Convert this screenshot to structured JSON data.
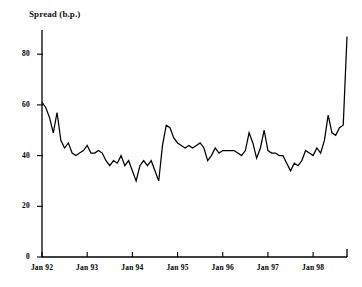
{
  "chart_data": {
    "type": "line",
    "title": "Spread (b.p.)",
    "xlabel": "",
    "ylabel": "Spread (b.p.)",
    "ylim": [
      0,
      92
    ],
    "yticks": [
      0,
      20,
      40,
      60,
      80
    ],
    "ytick_labels": [
      "0",
      "20",
      "40",
      "60",
      "80"
    ],
    "xticks": [
      "Jan 92",
      "Jan 93",
      "Jan 94",
      "Jan 95",
      "Jan 96",
      "Jan 97",
      "Jan 98"
    ],
    "xtick_labels": [
      "Jan 92",
      "Jan 93",
      "Jan 94",
      "Jan 95",
      "Jan 96",
      "Jan 97",
      "Jan 98"
    ],
    "xlim_labels": [
      "Jan 92",
      "Oct 98"
    ],
    "grid": false,
    "legend": "none",
    "line_color": "#000000",
    "x": [
      "Jan 92",
      "Feb 92",
      "Mar 92",
      "Apr 92",
      "May 92",
      "Jun 92",
      "Jul 92",
      "Aug 92",
      "Sep 92",
      "Oct 92",
      "Nov 92",
      "Dec 92",
      "Jan 93",
      "Feb 93",
      "Mar 93",
      "Apr 93",
      "May 93",
      "Jun 93",
      "Jul 93",
      "Aug 93",
      "Sep 93",
      "Oct 93",
      "Nov 93",
      "Dec 93",
      "Jan 94",
      "Feb 94",
      "Mar 94",
      "Apr 94",
      "May 94",
      "Jun 94",
      "Jul 94",
      "Aug 94",
      "Sep 94",
      "Oct 94",
      "Nov 94",
      "Dec 94",
      "Jan 95",
      "Feb 95",
      "Mar 95",
      "Apr 95",
      "May 95",
      "Jun 95",
      "Jul 95",
      "Aug 95",
      "Sep 95",
      "Oct 95",
      "Nov 95",
      "Dec 95",
      "Jan 96",
      "Feb 96",
      "Mar 96",
      "Apr 96",
      "May 96",
      "Jun 96",
      "Jul 96",
      "Aug 96",
      "Sep 96",
      "Oct 96",
      "Nov 96",
      "Dec 96",
      "Jan 97",
      "Feb 97",
      "Mar 97",
      "Apr 97",
      "May 97",
      "Jun 97",
      "Jul 97",
      "Aug 97",
      "Sep 97",
      "Oct 97",
      "Nov 97",
      "Dec 97",
      "Jan 98",
      "Feb 98",
      "Mar 98",
      "Apr 98",
      "May 98",
      "Jun 98",
      "Jul 98",
      "Aug 98",
      "Sep 98",
      "Oct 98"
    ],
    "values": [
      61,
      59,
      55,
      49,
      57,
      46,
      43,
      45,
      41,
      40,
      41,
      42,
      44,
      41,
      41,
      42,
      41,
      38,
      36,
      38,
      37,
      40,
      36,
      38,
      34,
      30,
      36,
      38,
      36,
      38,
      34,
      30,
      44,
      52,
      51,
      47,
      45,
      44,
      43,
      44,
      43,
      44,
      45,
      43,
      38,
      40,
      43,
      41,
      42,
      42,
      42,
      42,
      41,
      40,
      42,
      49,
      45,
      39,
      43,
      50,
      42,
      41,
      41,
      40,
      40,
      37,
      34,
      37,
      36,
      38,
      42,
      41,
      40,
      43,
      41,
      46,
      56,
      49,
      48,
      51,
      52,
      87
    ],
    "series": [
      {
        "name": "Spread",
        "values": [
          61,
          59,
          55,
          49,
          57,
          46,
          43,
          45,
          41,
          40,
          41,
          42,
          44,
          41,
          41,
          42,
          41,
          38,
          36,
          38,
          37,
          40,
          36,
          38,
          34,
          30,
          36,
          38,
          36,
          38,
          34,
          30,
          44,
          52,
          51,
          47,
          45,
          44,
          43,
          44,
          43,
          44,
          45,
          43,
          38,
          40,
          43,
          41,
          42,
          42,
          42,
          42,
          41,
          40,
          42,
          49,
          45,
          39,
          43,
          50,
          42,
          41,
          41,
          40,
          40,
          37,
          34,
          37,
          36,
          38,
          42,
          41,
          40,
          43,
          41,
          46,
          56,
          49,
          48,
          51,
          52,
          87
        ]
      }
    ],
    "annotations": []
  }
}
